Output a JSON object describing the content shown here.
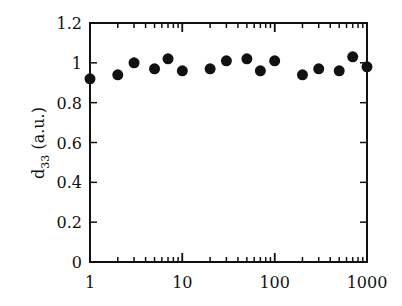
{
  "chart_data": {
    "type": "scatter",
    "title": "",
    "xlabel": "",
    "ylabel": "d33 (a.u.)",
    "ylabel_parts": {
      "main": "d",
      "sub": "33",
      "rest": " (a.u.)"
    },
    "xscale": "log",
    "xlim": [
      1,
      1000
    ],
    "ylim": [
      0,
      1.2
    ],
    "x_ticks": [
      1,
      10,
      100,
      1000
    ],
    "x_tick_labels": [
      "1",
      "10",
      "100",
      "1000"
    ],
    "y_ticks": [
      0,
      0.2,
      0.4,
      0.6,
      0.8,
      1,
      1.2
    ],
    "y_tick_labels": [
      "0",
      "0.2",
      "0.4",
      "0.6",
      "0.8",
      "1",
      "1.2"
    ],
    "grid": false,
    "legend": null,
    "marker_color": "#111111",
    "series": [
      {
        "name": "d33",
        "x": [
          1,
          2,
          3,
          5,
          7,
          10,
          20,
          30,
          50,
          70,
          100,
          200,
          300,
          500,
          700,
          1000
        ],
        "y": [
          0.92,
          0.94,
          1.0,
          0.97,
          1.02,
          0.96,
          0.97,
          1.01,
          1.02,
          0.96,
          1.01,
          0.94,
          0.97,
          0.96,
          1.03,
          0.98
        ]
      }
    ]
  }
}
